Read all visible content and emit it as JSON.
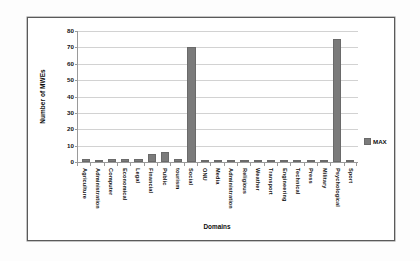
{
  "chart_data": {
    "type": "bar",
    "title": "",
    "xlabel": "Domains",
    "ylabel": "Number of MWEs",
    "ylim": [
      0,
      80
    ],
    "yticks": [
      0,
      10,
      20,
      30,
      40,
      50,
      60,
      70,
      80
    ],
    "grid": true,
    "legend_position": "right",
    "legend": [
      "MAX"
    ],
    "bar_color": "#7b7b7b",
    "categories": [
      "Agriculture",
      "Administration",
      "Computer",
      "Economical",
      "Legal",
      "Financial",
      "Public",
      "tourism",
      "Social",
      "ONU",
      "Media",
      "Administration",
      "Religious",
      "Weather",
      "Transport",
      "Engineering",
      "Technical",
      "Press",
      "Military",
      "Psychological",
      "Sport"
    ],
    "series": [
      {
        "name": "MAX",
        "values": [
          2,
          0,
          2,
          2,
          2,
          5,
          6,
          2,
          70,
          1,
          0,
          1,
          0,
          1,
          0,
          0,
          0,
          0,
          0,
          75,
          0
        ]
      }
    ]
  },
  "legend": {
    "entries": [
      {
        "label": "MAX",
        "color": "#7b7b7b",
        "swatch_icon": "square-swatch-icon"
      }
    ]
  },
  "axes": {
    "y_title": "Number of MWEs",
    "x_title": "Domains"
  }
}
